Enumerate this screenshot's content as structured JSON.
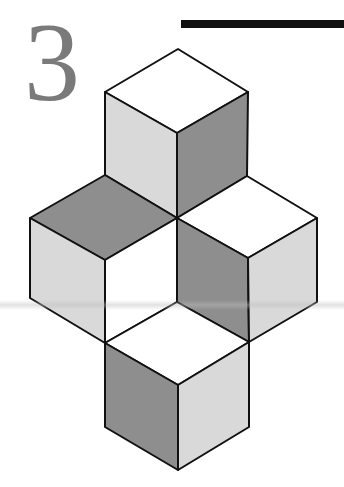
{
  "figure": {
    "label": "3",
    "colors": {
      "dark": "#8e8e8e",
      "light": "#d9d9d9",
      "white": "#ffffff",
      "stroke": "#111111",
      "label": "#7a7a7a"
    },
    "cubes": [
      {
        "name": "top-cube",
        "faces": {
          "top": "white",
          "left": "light",
          "right": "dark"
        }
      },
      {
        "name": "left-cube",
        "faces": {
          "top": "dark",
          "left": "light",
          "right": "white"
        }
      },
      {
        "name": "right-cube",
        "faces": {
          "top": "white",
          "left": "dark",
          "right": "light"
        }
      },
      {
        "name": "bottom-cube",
        "faces": {
          "top": "white",
          "left": "dark",
          "right": "light"
        }
      }
    ]
  }
}
